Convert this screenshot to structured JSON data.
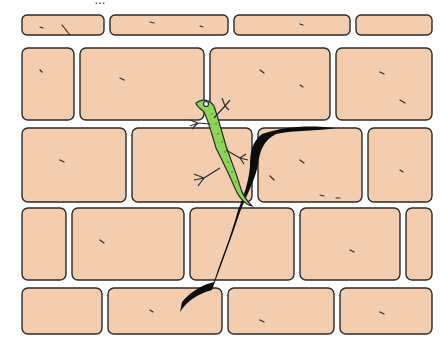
{
  "caption": "...",
  "scene": {
    "subject": "lizard-on-brick-wall",
    "colors": {
      "brick": "#f2cdb0",
      "mortar": "#ffffff",
      "outline": "#2a2a2a",
      "lizard": "#8fd45a",
      "lizard_spots": "#3e7a22",
      "crack": "#0c0c0c"
    }
  }
}
